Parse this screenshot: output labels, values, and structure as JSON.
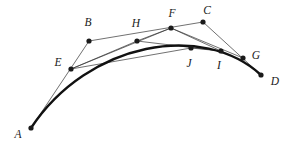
{
  "figure": {
    "width": 289,
    "height": 143,
    "background_color": "#ffffff",
    "dot_color": "#1a1a1a",
    "thin_line_color": "#333333",
    "curve_color": "#111111",
    "label_color": "#1a1a1a",
    "dot_radius": 2.6,
    "thin_line_width": 0.7,
    "curve_line_width": 2.4,
    "label_font_style": "italic serif"
  },
  "points": [
    {
      "id": "A",
      "label": "A",
      "x": 31,
      "y": 128,
      "label_x": 18,
      "label_y": 135
    },
    {
      "id": "B",
      "label": "B",
      "x": 89,
      "y": 41,
      "label_x": 88,
      "label_y": 23
    },
    {
      "id": "C",
      "label": "C",
      "x": 203,
      "y": 22,
      "label_x": 207,
      "label_y": 11
    },
    {
      "id": "D",
      "label": "D",
      "x": 261,
      "y": 75,
      "label_x": 275,
      "label_y": 82
    },
    {
      "id": "E",
      "label": "E",
      "x": 71,
      "y": 69,
      "label_x": 58,
      "label_y": 63
    },
    {
      "id": "F",
      "label": "F",
      "x": 171,
      "y": 28,
      "label_x": 172,
      "label_y": 14
    },
    {
      "id": "G",
      "label": "G",
      "x": 243,
      "y": 58,
      "label_x": 256,
      "label_y": 56
    },
    {
      "id": "H",
      "label": "H",
      "x": 137,
      "y": 41,
      "label_x": 136,
      "label_y": 24
    },
    {
      "id": "I",
      "label": "I",
      "x": 221,
      "y": 51,
      "label_x": 219,
      "label_y": 66
    },
    {
      "id": "J",
      "label": "J",
      "x": 191,
      "y": 48,
      "label_x": 189,
      "label_y": 64
    }
  ],
  "segments": [
    {
      "name": "segment-A-B",
      "from": "A",
      "to": "B"
    },
    {
      "name": "segment-B-C",
      "from": "B",
      "to": "C"
    },
    {
      "name": "segment-C-D",
      "from": "C",
      "to": "D"
    },
    {
      "name": "segment-E-F",
      "from": "E",
      "to": "F"
    },
    {
      "name": "segment-F-G",
      "from": "F",
      "to": "G"
    },
    {
      "name": "segment-E-H",
      "from": "E",
      "to": "H"
    },
    {
      "name": "segment-H-F",
      "from": "H",
      "to": "F"
    },
    {
      "name": "segment-H-I",
      "from": "H",
      "to": "I"
    },
    {
      "name": "segment-F-I",
      "from": "F",
      "to": "I"
    },
    {
      "name": "segment-J-I",
      "from": "J",
      "to": "I"
    },
    {
      "name": "segment-E-J",
      "from": "E",
      "to": "J"
    }
  ],
  "curve": {
    "name": "bezier-curve",
    "type": "cubic-bezier",
    "start": "A",
    "control_1": "B",
    "control_2": "C",
    "end": "D",
    "path": "M 31 128 C 89 41 203 22 261 75"
  }
}
